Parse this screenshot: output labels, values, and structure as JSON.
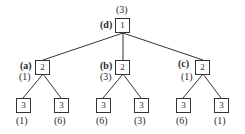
{
  "diagram": {
    "type": "tree",
    "root": {
      "id": "d",
      "tag": "(d)",
      "value": "1",
      "annotation": "(3)",
      "children": [
        {
          "id": "a",
          "tag": "(a)",
          "value": "2",
          "annotation": "(1)",
          "children": [
            {
              "value": "3",
              "annotation": "(1)"
            },
            {
              "value": "3",
              "annotation": "(6)"
            }
          ]
        },
        {
          "id": "b",
          "tag": "(b)",
          "value": "2",
          "annotation": "(3)",
          "children": [
            {
              "value": "3",
              "annotation": "(6)"
            },
            {
              "value": "3",
              "annotation": "(3)"
            }
          ]
        },
        {
          "id": "c",
          "tag": "(c)",
          "value": "2",
          "annotation": "(1)",
          "children": [
            {
              "value": "3",
              "annotation": "(6)"
            },
            {
              "value": "3",
              "annotation": "(1)"
            }
          ]
        }
      ]
    }
  },
  "colors": {
    "line": "#333333",
    "text": "#2a2a2a",
    "background": "#ffffff"
  }
}
